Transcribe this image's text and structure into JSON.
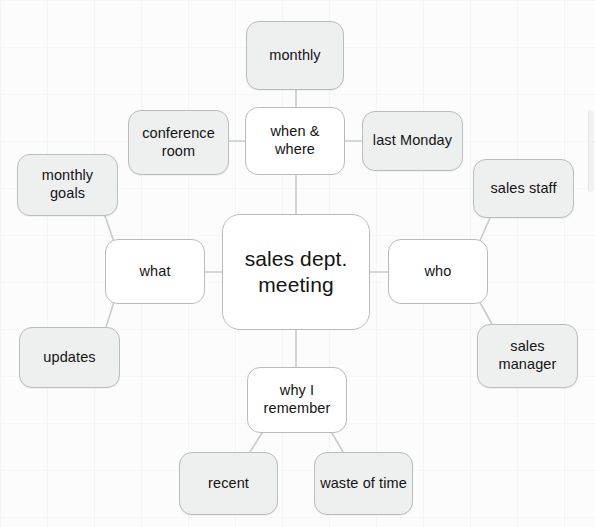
{
  "diagram": {
    "type": "mind-map",
    "title": "sales dept. meeting",
    "background_color": "#fcfcfc",
    "node_fill_center": "#ffffff",
    "node_fill_branch": "#ffffff",
    "node_fill_leaf": "#eeefef",
    "node_border_color": "#b9bcbe",
    "edge_color": "#c8cbcd",
    "center": {
      "id": "center",
      "label": "sales dept.\nmeeting",
      "x": 222,
      "y": 214,
      "w": 148,
      "h": 116
    },
    "branches": [
      {
        "id": "when-where",
        "label": "when &\nwhere",
        "x": 245,
        "y": 107,
        "w": 100,
        "h": 68
      },
      {
        "id": "what",
        "label": "what",
        "x": 105,
        "y": 239,
        "w": 100,
        "h": 65
      },
      {
        "id": "who",
        "label": "who",
        "x": 388,
        "y": 239,
        "w": 100,
        "h": 65
      },
      {
        "id": "why-i-remember",
        "label": "why I\nremember",
        "x": 247,
        "y": 367,
        "w": 100,
        "h": 66
      }
    ],
    "leaves": [
      {
        "id": "monthly",
        "label": "monthly",
        "parent": "when-where",
        "x": 246,
        "y": 21,
        "w": 98,
        "h": 69
      },
      {
        "id": "conference-room",
        "label": "conference\nroom",
        "parent": "when-where",
        "x": 128,
        "y": 110,
        "w": 101,
        "h": 65
      },
      {
        "id": "last-monday",
        "label": "last Monday",
        "parent": "when-where",
        "x": 362,
        "y": 111,
        "w": 101,
        "h": 60
      },
      {
        "id": "monthly-goals",
        "label": "monthly\ngoals",
        "parent": "what",
        "x": 17,
        "y": 154,
        "w": 101,
        "h": 62
      },
      {
        "id": "updates",
        "label": "updates",
        "parent": "what",
        "x": 19,
        "y": 327,
        "w": 101,
        "h": 61
      },
      {
        "id": "sales-staff",
        "label": "sales staff",
        "parent": "who",
        "x": 473,
        "y": 159,
        "w": 101,
        "h": 59
      },
      {
        "id": "sales-manager",
        "label": "sales\nmanager",
        "parent": "who",
        "x": 477,
        "y": 324,
        "w": 101,
        "h": 64
      },
      {
        "id": "recent",
        "label": "recent",
        "parent": "why-i-remember",
        "x": 179,
        "y": 452,
        "w": 99,
        "h": 63
      },
      {
        "id": "waste-of-time",
        "label": "waste of time",
        "parent": "why-i-remember",
        "x": 314,
        "y": 452,
        "w": 99,
        "h": 63
      }
    ],
    "edges": [
      {
        "id": "center-when-where",
        "from": "center",
        "to": "when-where",
        "x1": 296,
        "y1": 214,
        "x2": 296,
        "y2": 175
      },
      {
        "id": "center-what",
        "from": "center",
        "to": "what",
        "x1": 222,
        "y1": 272,
        "x2": 205,
        "y2": 272
      },
      {
        "id": "center-who",
        "from": "center",
        "to": "who",
        "x1": 370,
        "y1": 272,
        "x2": 388,
        "y2": 272
      },
      {
        "id": "center-why-i-remember",
        "from": "center",
        "to": "why-i-remember",
        "x1": 296,
        "y1": 330,
        "x2": 296,
        "y2": 367
      },
      {
        "id": "when-where-monthly",
        "from": "when-where",
        "to": "monthly",
        "x1": 296,
        "y1": 107,
        "x2": 296,
        "y2": 90
      },
      {
        "id": "when-where-conference-room",
        "from": "when-where",
        "to": "conference-room",
        "x1": 245,
        "y1": 141,
        "x2": 229,
        "y2": 141
      },
      {
        "id": "when-where-last-monday",
        "from": "when-where",
        "to": "last-monday",
        "x1": 345,
        "y1": 141,
        "x2": 362,
        "y2": 141
      },
      {
        "id": "what-monthly-goals",
        "from": "what",
        "to": "monthly-goals",
        "x1": 115,
        "y1": 245,
        "x2": 105,
        "y2": 216
      },
      {
        "id": "what-updates",
        "from": "what",
        "to": "updates",
        "x1": 115,
        "y1": 299,
        "x2": 106,
        "y2": 327
      },
      {
        "id": "who-sales-staff",
        "from": "who",
        "to": "sales-staff",
        "x1": 478,
        "y1": 245,
        "x2": 490,
        "y2": 218
      },
      {
        "id": "who-sales-manager",
        "from": "who",
        "to": "sales-manager",
        "x1": 478,
        "y1": 299,
        "x2": 492,
        "y2": 324
      },
      {
        "id": "why-i-remember-recent",
        "from": "why-i-remember",
        "to": "recent",
        "x1": 262,
        "y1": 433,
        "x2": 250,
        "y2": 452
      },
      {
        "id": "why-i-remember-waste-of-time",
        "from": "why-i-remember",
        "to": "waste-of-time",
        "x1": 332,
        "y1": 433,
        "x2": 343,
        "y2": 452
      }
    ]
  }
}
